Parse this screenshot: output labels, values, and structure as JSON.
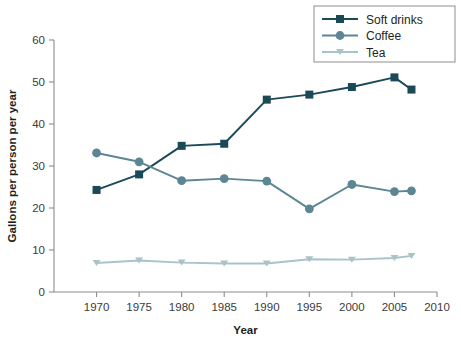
{
  "chart_data": {
    "type": "line",
    "title": "",
    "xlabel": "Year",
    "ylabel": "Gallons per person per year",
    "xlim": [
      1965,
      2010
    ],
    "ylim": [
      0,
      60
    ],
    "xticks": [
      1970,
      1975,
      1980,
      1985,
      1990,
      1995,
      2000,
      2005,
      2010
    ],
    "yticks": [
      0,
      10,
      20,
      30,
      40,
      50,
      60
    ],
    "grid": false,
    "legend_position": "top-right",
    "x": [
      1970,
      1975,
      1980,
      1985,
      1990,
      1995,
      2000,
      2005,
      2007
    ],
    "series": [
      {
        "name": "Soft drinks",
        "color": "#1b4a57",
        "marker": "square",
        "values": [
          24.3,
          28.0,
          34.8,
          35.3,
          45.8,
          47.0,
          48.8,
          51.1,
          48.2
        ]
      },
      {
        "name": "Coffee",
        "color": "#5c8693",
        "marker": "circle",
        "values": [
          33.1,
          31.0,
          26.5,
          27.0,
          26.4,
          19.8,
          25.6,
          23.9,
          24.1
        ]
      },
      {
        "name": "Tea",
        "color": "#a9c3c8",
        "marker": "triangle-down",
        "values": [
          6.9,
          7.5,
          7.0,
          6.8,
          6.8,
          7.8,
          7.7,
          8.1,
          8.6
        ]
      }
    ]
  },
  "axes": {
    "x_title": "Year",
    "y_title": "Gallons per person per year",
    "x_tick_labels": [
      "1970",
      "1975",
      "1980",
      "1985",
      "1990",
      "1995",
      "2000",
      "2005",
      "2010"
    ],
    "y_tick_labels": [
      "0",
      "10",
      "20",
      "30",
      "40",
      "50",
      "60"
    ]
  },
  "legend": {
    "entries": [
      {
        "label": "Soft drinks",
        "color": "#1b4a57",
        "marker": "square"
      },
      {
        "label": "Coffee",
        "color": "#5c8693",
        "marker": "circle"
      },
      {
        "label": "Tea",
        "color": "#a9c3c8",
        "marker": "triangle-down"
      }
    ]
  },
  "colors": {
    "soft_drinks": "#1b4a57",
    "coffee": "#5c8693",
    "tea": "#a9c3c8",
    "axis": "#8d8d8d",
    "text": "#231f20",
    "background": "#ffffff"
  }
}
